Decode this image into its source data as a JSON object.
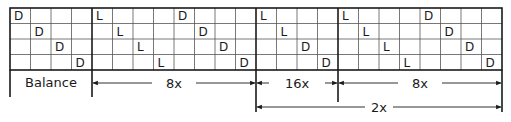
{
  "grid": {
    "rows": 4,
    "columns": 24,
    "cells": [
      [
        "D",
        "",
        "",
        "",
        "L",
        "",
        "",
        "",
        "D",
        "",
        "",
        "",
        "L",
        "",
        "",
        "",
        "L",
        "",
        "",
        "",
        "D",
        "",
        "",
        ""
      ],
      [
        "",
        "D",
        "",
        "",
        "",
        "L",
        "",
        "",
        "",
        "D",
        "",
        "",
        "",
        "L",
        "",
        "",
        "",
        "L",
        "",
        "",
        "",
        "D",
        "",
        ""
      ],
      [
        "",
        "",
        "D",
        "",
        "",
        "",
        "L",
        "",
        "",
        "",
        "D",
        "",
        "",
        "",
        "D",
        "",
        "",
        "",
        "L",
        "",
        "",
        "",
        "D",
        ""
      ],
      [
        "",
        "",
        "",
        "D",
        "",
        "",
        "",
        "L",
        "",
        "",
        "",
        "D",
        "",
        "",
        "",
        "D",
        "",
        "",
        "",
        "L",
        "",
        "",
        "",
        "D"
      ]
    ],
    "section_boundaries": [
      4,
      12,
      16
    ]
  },
  "sections": [
    {
      "label": "Balance",
      "start_col": 0,
      "end_col": 4
    },
    {
      "label": "8x",
      "start_col": 4,
      "end_col": 12
    },
    {
      "label": "16x",
      "start_col": 12,
      "end_col": 16
    },
    {
      "label": "8x",
      "start_col": 16,
      "end_col": 24
    }
  ],
  "span_annotation": {
    "label": "2x",
    "start_col": 12,
    "end_col": 24
  },
  "colors": {
    "line": "#1a1a1a",
    "grid": "#555555",
    "background": "#ffffff"
  }
}
